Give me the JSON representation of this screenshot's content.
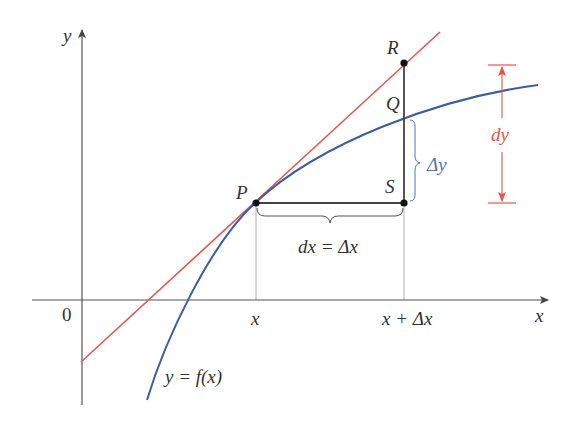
{
  "figure": {
    "axes": {
      "x_label": "x",
      "y_label": "y",
      "origin_label": "0"
    },
    "points": {
      "P": "P",
      "Q": "Q",
      "R": "R",
      "S": "S"
    },
    "tick_labels": {
      "x": "x",
      "x_plus_dx": "x + Δx"
    },
    "annotations": {
      "dx": "dx = Δx",
      "delta_y": "Δy",
      "dy": "dy",
      "curve": "y = f(x)"
    },
    "colors": {
      "tangent": "#e8544c",
      "curve": "#3b5ca8",
      "axes": "#555555",
      "dy_annotation": "#e8544c",
      "delta_y_annotation": "#5a72b5"
    }
  }
}
